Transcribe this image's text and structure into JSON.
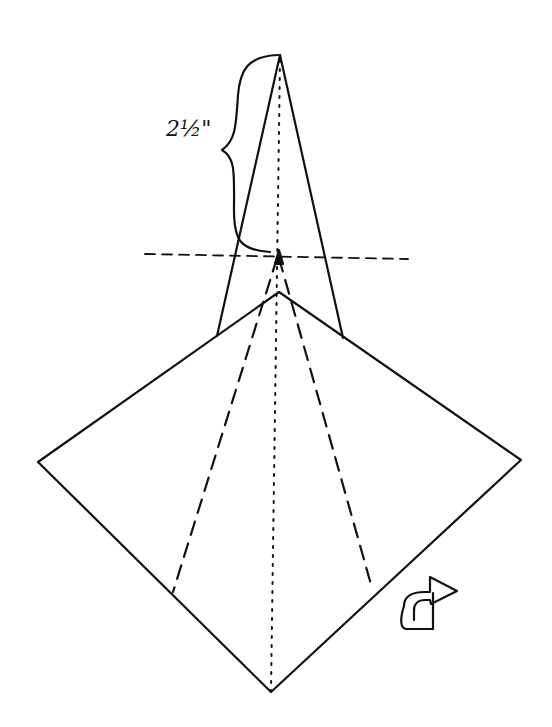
{
  "diagram": {
    "type": "origami-fold-diagram",
    "measurement_label": "2½\"",
    "colors": {
      "ink": "#111111",
      "background": "#ffffff"
    },
    "elements": [
      "square-diamond-base",
      "narrow-flap-triangle",
      "vertical-center-dotted-line",
      "horizontal-dashed-reference-line",
      "two-valley-fold-dashed-lines",
      "measurement-brace",
      "turn-over-arrow-icon"
    ]
  }
}
